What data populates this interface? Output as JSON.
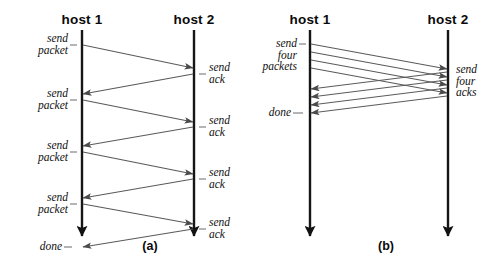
{
  "figure": {
    "title_a": "(a)",
    "title_b": "(b)",
    "background_color": "#ffffff",
    "line_color": "#1a1a1a",
    "arrow_color": "#555555"
  },
  "panel_a": {
    "caption": "(a)",
    "host_left": "host 1",
    "host_right": "host 2",
    "left_labels": [
      "send\npacket",
      "send\npacket",
      "send\npacket",
      "send\npacket",
      "done"
    ],
    "right_labels": [
      "send\nack",
      "send\nack",
      "send\nack",
      "send\nack"
    ]
  },
  "panel_b": {
    "caption": "(b)",
    "host_left": "host 1",
    "host_right": "host 2",
    "left_labels": [
      "send\nfour\npackets",
      "done"
    ],
    "right_labels": [
      "send\nfour\nacks"
    ]
  },
  "chart_data": {
    "type": "diagram",
    "subtype": "sequence-timing-diagram",
    "panels": [
      {
        "id": "a",
        "caption": "(a)",
        "participants": [
          "host 1",
          "host 2"
        ],
        "messages": [
          {
            "from": "host 1",
            "to": "host 2",
            "label": "send packet",
            "label_side": "left",
            "start_y": 44,
            "end_y": 68
          },
          {
            "from": "host 2",
            "to": "host 1",
            "label": "send ack",
            "label_side": "right",
            "start_y": 73,
            "end_y": 94
          },
          {
            "from": "host 1",
            "to": "host 2",
            "label": "send packet",
            "label_side": "left",
            "start_y": 100,
            "end_y": 122
          },
          {
            "from": "host 2",
            "to": "host 1",
            "label": "send ack",
            "label_side": "right",
            "start_y": 126,
            "end_y": 146
          },
          {
            "from": "host 1",
            "to": "host 2",
            "label": "send packet",
            "label_side": "left",
            "start_y": 152,
            "end_y": 174
          },
          {
            "from": "host 2",
            "to": "host 1",
            "label": "send ack",
            "label_side": "right",
            "start_y": 179,
            "end_y": 198
          },
          {
            "from": "host 1",
            "to": "host 2",
            "label": "send packet",
            "label_side": "left",
            "start_y": 203,
            "end_y": 224
          },
          {
            "from": "host 2",
            "to": "host 1",
            "label": "send ack",
            "label_side": "right",
            "start_y": 208,
            "end_y": 228
          }
        ],
        "terminal_label": "done"
      },
      {
        "id": "b",
        "caption": "(b)",
        "participants": [
          "host 1",
          "host 2"
        ],
        "packet_count": 4,
        "messages": [
          {
            "from": "host 1",
            "to": "host 2",
            "label": "send four packets",
            "label_side": "left"
          },
          {
            "from": "host 2",
            "to": "host 1",
            "label": "send four acks",
            "label_side": "right"
          }
        ],
        "terminal_label": "done"
      }
    ]
  }
}
